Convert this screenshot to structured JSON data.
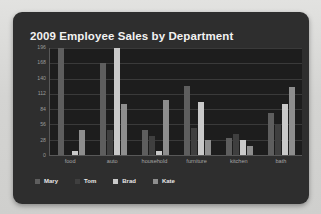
{
  "card": {
    "background_color": "#2e2e2e",
    "plot_background_color": "#1d1d1d"
  },
  "chart_data": {
    "type": "bar",
    "title": "2009 Employee Sales by Department",
    "xlabel": "",
    "ylabel": "",
    "categories": [
      "food",
      "auto",
      "household",
      "furniture",
      "kitchen",
      "bath"
    ],
    "series": [
      {
        "name": "Mary",
        "color": "#5e5e5e",
        "values": [
          196,
          168,
          45,
          126,
          31,
          77
        ]
      },
      {
        "name": "Tom",
        "color": "#3f3f3f",
        "values": [
          0,
          45,
          35,
          50,
          38,
          56
        ]
      },
      {
        "name": "Brad",
        "color": "#c9c9c9",
        "values": [
          8,
          196,
          8,
          98,
          28,
          93
        ]
      },
      {
        "name": "Kate",
        "color": "#8e8e8e",
        "values": [
          45,
          93,
          100,
          28,
          16,
          124
        ]
      }
    ],
    "yticks": [
      0,
      28,
      56,
      84,
      112,
      140,
      168,
      196
    ],
    "ylim": [
      0,
      196
    ],
    "grid": true,
    "legend_position": "bottom-left"
  }
}
